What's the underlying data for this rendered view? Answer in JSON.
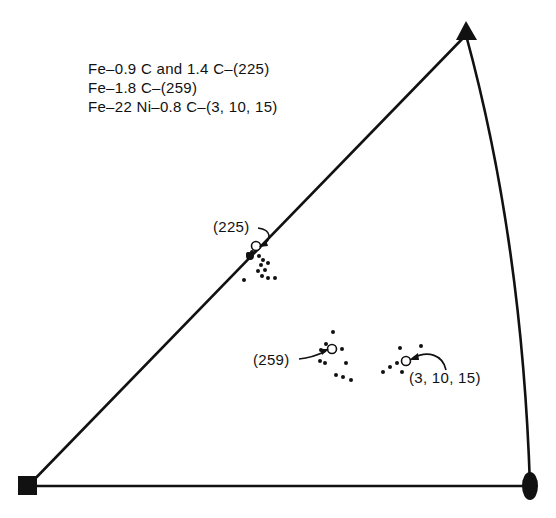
{
  "figure": {
    "type": "stereographic-triangle",
    "legend": [
      "Fe–0.9 C and 1.4 C–(225)",
      "Fe–1.8 C–(259)",
      "Fe–22 Ni–0.8 C–(3, 10, 15)"
    ],
    "labels": {
      "p225": "(225)",
      "p259": "(259)",
      "p31015": "(3, 10, 15)"
    },
    "corners": {
      "square": {
        "x": 28,
        "y": 486
      },
      "triangle": {
        "x": 466,
        "y": 35
      },
      "lens": {
        "x": 530,
        "y": 486
      }
    },
    "poles": {
      "p225": {
        "x": 256,
        "y": 246
      },
      "p259": {
        "x": 332,
        "y": 349
      },
      "p31015": {
        "x": 406,
        "y": 361
      }
    },
    "scatter": {
      "p225": [
        [
          248,
          254
        ],
        [
          252,
          252
        ],
        [
          250,
          258
        ],
        [
          259,
          256
        ],
        [
          263,
          260
        ],
        [
          268,
          263
        ],
        [
          261,
          265
        ],
        [
          258,
          271
        ],
        [
          265,
          270
        ],
        [
          262,
          276
        ],
        [
          268,
          278
        ],
        [
          275,
          278
        ],
        [
          244,
          280
        ],
        [
          255,
          248
        ]
      ],
      "p259": [
        [
          333,
          332
        ],
        [
          326,
          344
        ],
        [
          321,
          350
        ],
        [
          342,
          349
        ],
        [
          320,
          361
        ],
        [
          325,
          363
        ],
        [
          346,
          363
        ],
        [
          336,
          375
        ],
        [
          343,
          377
        ],
        [
          351,
          380
        ]
      ],
      "p31015": [
        [
          400,
          348
        ],
        [
          421,
          346
        ],
        [
          397,
          363
        ],
        [
          390,
          367
        ],
        [
          383,
          372
        ],
        [
          402,
          372
        ]
      ]
    }
  }
}
